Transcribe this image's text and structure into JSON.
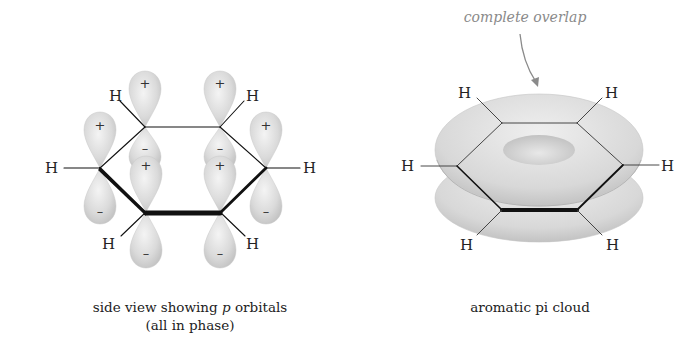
{
  "left_panel": {
    "title_line1_prefix": "side view showing ",
    "title_line1_italic": "p",
    "title_line1_suffix": " orbitals",
    "title_line2": "(all in phase)",
    "atom_label": "H",
    "positive_sign": "+",
    "negative_sign": "–"
  },
  "right_panel": {
    "annotation": "complete overlap",
    "caption": "aromatic pi cloud",
    "atom_label": "H"
  },
  "colors": {
    "orbital_fill": "#d6d6d6",
    "orbital_highlight": "#f2f2f2",
    "bond": "#111111",
    "annotation": "#8a8a8a"
  }
}
